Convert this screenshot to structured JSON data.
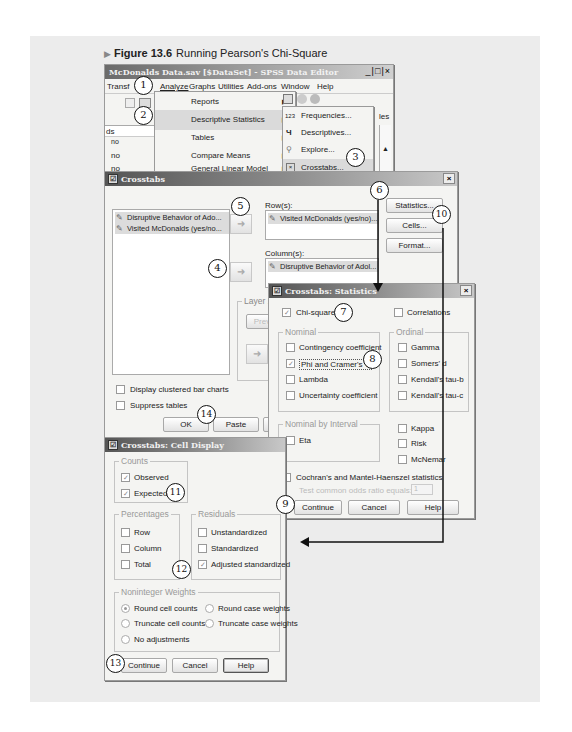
{
  "figure": {
    "label": "Figure 13.6",
    "title": "Running Pearson's Chi-Square"
  },
  "data_editor": {
    "title": "McDonalds Data.sav [$DataSet] - SPSS Data Editor",
    "window_controls": [
      "_",
      "□",
      "×"
    ],
    "menubar": [
      "Transform",
      "Analyze",
      "Graphs",
      "Utilities",
      "Add-ons",
      "Window",
      "Help"
    ],
    "menubar_visible": [
      "Transf",
      "Analyze",
      "Graphs",
      "Utilities",
      "Add-ons",
      "Window",
      "Help"
    ],
    "column_header_fragment": "ds",
    "right_fragment": "les",
    "cells": [
      "no",
      "no",
      "no"
    ]
  },
  "analyze_menu": {
    "items": [
      {
        "label": "Reports",
        "has_submenu": true
      },
      {
        "label": "Descriptive Statistics",
        "has_submenu": true,
        "highlighted": true
      },
      {
        "label": "Tables",
        "has_submenu": true
      },
      {
        "label": "Compare Means",
        "has_submenu": true
      },
      {
        "label": "General Linear Model",
        "has_submenu": true
      }
    ]
  },
  "descriptive_submenu": {
    "items": [
      {
        "icon": "123",
        "label": "Frequencies..."
      },
      {
        "icon": "descriptives-icon",
        "label": "Descriptives..."
      },
      {
        "icon": "explore-icon",
        "label": "Explore..."
      },
      {
        "icon": "crosstabs-icon",
        "label": "Crosstabs...",
        "highlighted": true
      }
    ]
  },
  "crosstabs": {
    "title": "Crosstabs",
    "source_list": [
      "Disruptive Behavior of Ado...",
      "Visited McDonalds (yes/no..."
    ],
    "rows_label": "Row(s):",
    "rows": [
      "Visited McDonalds (yes/no)..."
    ],
    "columns_label": "Column(s):",
    "columns": [
      "Disruptive Behavior of Adol..."
    ],
    "layer_label": "Layer 1",
    "layer_prev": "Prev",
    "buttons": [
      "Statistics...",
      "Cells...",
      "Format..."
    ],
    "checkboxes": [
      {
        "label": "Display clustered bar charts",
        "checked": false
      },
      {
        "label": "Suppress tables",
        "checked": false
      }
    ],
    "footer_buttons": [
      "OK",
      "Paste"
    ]
  },
  "statistics_dialog": {
    "title": "Crosstabs: Statistics",
    "chi_square": {
      "label": "Chi-square",
      "checked": true
    },
    "correlations": {
      "label": "Correlations",
      "checked": false
    },
    "nominal": {
      "title": "Nominal",
      "items": [
        {
          "label": "Contingency coefficient",
          "checked": false
        },
        {
          "label": "Phi and Cramer's V",
          "checked": true
        },
        {
          "label": "Lambda",
          "checked": false
        },
        {
          "label": "Uncertainty coefficient",
          "checked": false
        }
      ]
    },
    "ordinal": {
      "title": "Ordinal",
      "items": [
        {
          "label": "Gamma",
          "checked": false
        },
        {
          "label": "Somers' d",
          "checked": false
        },
        {
          "label": "Kendall's tau-b",
          "checked": false
        },
        {
          "label": "Kendall's tau-c",
          "checked": false
        }
      ]
    },
    "nominal_by_interval": {
      "title": "Nominal by Interval",
      "items": [
        {
          "label": "Eta",
          "checked": false
        }
      ]
    },
    "other": [
      {
        "label": "Kappa",
        "checked": false
      },
      {
        "label": "Risk",
        "checked": false
      },
      {
        "label": "McNemar",
        "checked": false
      }
    ],
    "cochran": {
      "label": "Cochran's and Mantel-Haenszel statistics",
      "checked": false
    },
    "test_ratio_label": "Test common odds ratio equals:",
    "test_ratio_value": "1",
    "buttons": [
      "Continue",
      "Cancel",
      "Help"
    ]
  },
  "cell_display_dialog": {
    "title": "Crosstabs: Cell Display",
    "counts": {
      "title": "Counts",
      "items": [
        {
          "label": "Observed",
          "checked": true
        },
        {
          "label": "Expected",
          "checked": true
        }
      ]
    },
    "percentages": {
      "title": "Percentages",
      "items": [
        {
          "label": "Row",
          "checked": false
        },
        {
          "label": "Column",
          "checked": false
        },
        {
          "label": "Total",
          "checked": false
        }
      ]
    },
    "residuals": {
      "title": "Residuals",
      "items": [
        {
          "label": "Unstandardized",
          "checked": false
        },
        {
          "label": "Standardized",
          "checked": false
        },
        {
          "label": "Adjusted standardized",
          "checked": true
        }
      ]
    },
    "weights": {
      "title": "Noninteger Weights",
      "options": [
        {
          "label": "Round cell counts",
          "selected": true
        },
        {
          "label": "Round case weights",
          "selected": false
        },
        {
          "label": "Truncate cell counts",
          "selected": false
        },
        {
          "label": "Truncate case weights",
          "selected": false
        },
        {
          "label": "No adjustments",
          "selected": false
        }
      ]
    },
    "buttons": [
      "Continue",
      "Cancel",
      "Help"
    ]
  },
  "callouts": [
    "1",
    "2",
    "3",
    "4",
    "5",
    "6",
    "7",
    "8",
    "9",
    "10",
    "11",
    "12",
    "13",
    "14"
  ]
}
